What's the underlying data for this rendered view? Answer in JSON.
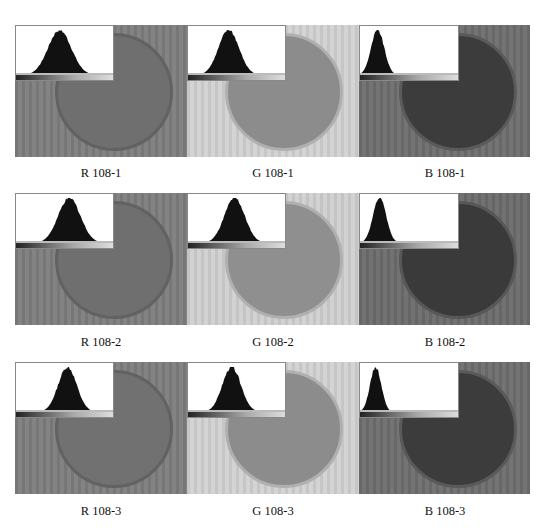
{
  "figure": {
    "rows": [
      {
        "panels": [
          {
            "label": "R 108-1",
            "channel": "R",
            "sample": "108-1",
            "bg": "#7e7e7e",
            "dish_fill": "#6f6f6f",
            "dish_border": "#626262",
            "hist_peak": 0.45,
            "hist_width": 0.25
          },
          {
            "label": "G 108-1",
            "channel": "G",
            "sample": "108-1",
            "bg": "#d2d2d2",
            "dish_fill": "#8c8c8c",
            "dish_border": "#b0b0b0",
            "hist_peak": 0.42,
            "hist_width": 0.22
          },
          {
            "label": "B 108-1",
            "channel": "B",
            "sample": "108-1",
            "bg": "#6e6e6e",
            "dish_fill": "#3c3c3c",
            "dish_border": "#5a5a5a",
            "hist_peak": 0.18,
            "hist_width": 0.14
          }
        ]
      },
      {
        "panels": [
          {
            "label": "R 108-2",
            "channel": "R",
            "sample": "108-2",
            "bg": "#7e7e7e",
            "dish_fill": "#6f6f6f",
            "dish_border": "#626262",
            "hist_peak": 0.55,
            "hist_width": 0.24
          },
          {
            "label": "G 108-2",
            "channel": "G",
            "sample": "108-2",
            "bg": "#d0d0d0",
            "dish_fill": "#8f8f8f",
            "dish_border": "#b0b0b0",
            "hist_peak": 0.48,
            "hist_width": 0.22
          },
          {
            "label": "B 108-2",
            "channel": "B",
            "sample": "108-2",
            "bg": "#6c6c6c",
            "dish_fill": "#3a3a3a",
            "dish_border": "#575757",
            "hist_peak": 0.2,
            "hist_width": 0.14
          }
        ]
      },
      {
        "panels": [
          {
            "label": "R 108-3",
            "channel": "R",
            "sample": "108-3",
            "bg": "#7e7e7e",
            "dish_fill": "#717171",
            "dish_border": "#626262",
            "hist_peak": 0.53,
            "hist_width": 0.2
          },
          {
            "label": "G 108-3",
            "channel": "G",
            "sample": "108-3",
            "bg": "#d2d2d2",
            "dish_fill": "#8c8c8c",
            "dish_border": "#b0b0b0",
            "hist_peak": 0.45,
            "hist_width": 0.2
          },
          {
            "label": "B 108-3",
            "channel": "B",
            "sample": "108-3",
            "bg": "#6e6e6e",
            "dish_fill": "#3c3c3c",
            "dish_border": "#5a5a5a",
            "hist_peak": 0.16,
            "hist_width": 0.12
          }
        ]
      }
    ]
  }
}
